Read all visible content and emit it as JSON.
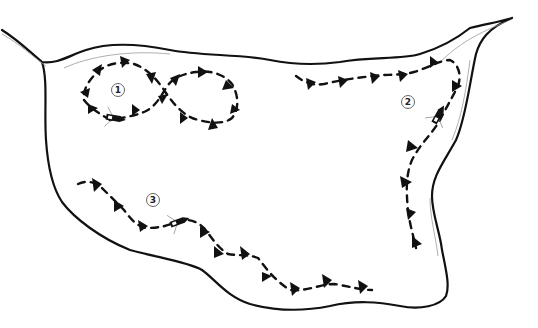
{
  "diagram": {
    "type": "lake-trolling-patterns",
    "colors": {
      "background": "#ffffff",
      "shoreline": "#111111",
      "shoreline_inner": "#9a9a9a",
      "path": "#111111",
      "label_border": "#555555"
    },
    "patterns": [
      {
        "id": 1,
        "label": "1",
        "description": "figure-eight loop"
      },
      {
        "id": 2,
        "label": "2",
        "description": "follow shoreline around point"
      },
      {
        "id": 3,
        "label": "3",
        "description": "follow bottom contour along shore"
      }
    ],
    "icons": [
      "boat-icon",
      "direction-arrow-icon"
    ]
  }
}
